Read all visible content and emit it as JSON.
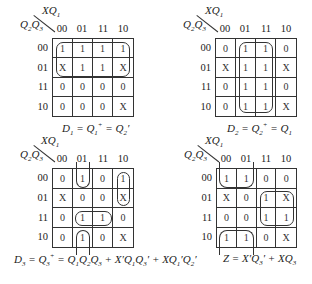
{
  "maps": [
    {
      "id": "D1",
      "col_var": "XQ1",
      "row_var": "Q2Q3",
      "col_labels": [
        "00",
        "01",
        "11",
        "10"
      ],
      "row_labels": [
        "00",
        "01",
        "11",
        "10"
      ],
      "cells": [
        [
          "1",
          "1",
          "1",
          "1"
        ],
        [
          "X",
          "1",
          "1",
          "X"
        ],
        [
          "0",
          "0",
          "0",
          "0"
        ],
        [
          "0",
          "0",
          "0",
          "X"
        ]
      ],
      "caption": "D1 = Q1+ = Q2'"
    },
    {
      "id": "D2",
      "col_var": "XQ1",
      "row_var": "Q2Q3",
      "col_labels": [
        "00",
        "01",
        "11",
        "10"
      ],
      "row_labels": [
        "00",
        "01",
        "11",
        "10"
      ],
      "cells": [
        [
          "0",
          "1",
          "1",
          "0"
        ],
        [
          "X",
          "1",
          "1",
          "X"
        ],
        [
          "0",
          "1",
          "1",
          "0"
        ],
        [
          "0",
          "1",
          "1",
          "X"
        ]
      ],
      "caption": "D2 = Q2+ = Q1"
    },
    {
      "id": "D3",
      "col_var": "XQ1",
      "row_var": "Q2Q3",
      "col_labels": [
        "00",
        "01",
        "11",
        "10"
      ],
      "row_labels": [
        "00",
        "01",
        "11",
        "10"
      ],
      "cells": [
        [
          "0",
          "1",
          "0",
          "1"
        ],
        [
          "X",
          "0",
          "0",
          "X"
        ],
        [
          "0",
          "1",
          "1",
          "0"
        ],
        [
          "0",
          "1",
          "0",
          "X"
        ]
      ],
      "caption": "D3 = Q3+ = Q1Q2Q3 + X'Q1Q3' + XQ1'Q2'"
    },
    {
      "id": "Z",
      "col_var": "XQ1",
      "row_var": "Q2Q3",
      "col_labels": [
        "00",
        "01",
        "11",
        "10"
      ],
      "row_labels": [
        "00",
        "01",
        "11",
        "10"
      ],
      "cells": [
        [
          "1",
          "1",
          "0",
          "0"
        ],
        [
          "X",
          "0",
          "1",
          "X"
        ],
        [
          "0",
          "0",
          "1",
          "1"
        ],
        [
          "1",
          "1",
          "0",
          "X"
        ]
      ],
      "caption": "Z = X'Q3' + XQ3"
    }
  ]
}
